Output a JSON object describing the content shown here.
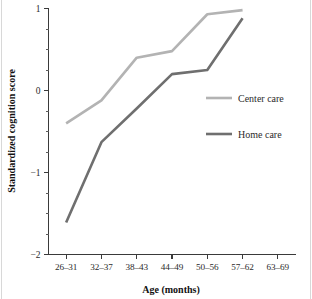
{
  "figure": {
    "background_color": "#ffffff",
    "frame_color": "#d8d8d8"
  },
  "chart_data": {
    "type": "line",
    "title": "",
    "xlabel": "Age (months)",
    "ylabel": "Standardized cognition score",
    "categories": [
      "26–31",
      "32–37",
      "38–43",
      "44–49",
      "50–56",
      "57–62",
      "63–69"
    ],
    "ylim": [
      -2,
      1
    ],
    "ytick_labels": [
      "1",
      "0",
      "−1",
      "−2"
    ],
    "ytick_values": [
      1,
      0,
      -1,
      -2
    ],
    "yminor_step": 0.25,
    "grid": false,
    "legend_position": "center-right",
    "series": [
      {
        "name": "Center care",
        "color": "#b3b3b3",
        "values": [
          -0.4,
          -0.12,
          0.4,
          0.48,
          0.93,
          0.98,
          null
        ]
      },
      {
        "name": "Home care",
        "color": "#6f6f6f",
        "values": [
          -1.61,
          -0.63,
          -0.22,
          0.2,
          0.25,
          0.88,
          null
        ]
      }
    ]
  },
  "legend": {
    "entries": [
      {
        "label": "Center care",
        "color": "#b3b3b3"
      },
      {
        "label": "Home care",
        "color": "#6f6f6f"
      }
    ]
  }
}
